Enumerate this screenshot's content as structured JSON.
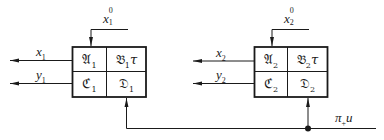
{
  "diagram": {
    "blocks": [
      {
        "id": "block-1",
        "input_label": {
          "base": "x",
          "sup": "0",
          "sub": "1"
        },
        "outputs": [
          {
            "base": "x",
            "sub": "1"
          },
          {
            "base": "y",
            "sub": "1"
          }
        ],
        "cells": {
          "top_left": {
            "base": "𝔄",
            "sub": "1",
            "suffix": ""
          },
          "top_right": {
            "base": "𝔅",
            "sub": "1",
            "suffix": "τ"
          },
          "bottom_left": {
            "base": "ℭ",
            "sub": "1",
            "suffix": ""
          },
          "bottom_right": {
            "base": "𝔇",
            "sub": "1",
            "suffix": ""
          }
        }
      },
      {
        "id": "block-2",
        "input_label": {
          "base": "x",
          "sup": "0",
          "sub": "2"
        },
        "outputs": [
          {
            "base": "x",
            "sub": "2"
          },
          {
            "base": "y",
            "sub": "2"
          }
        ],
        "cells": {
          "top_left": {
            "base": "𝔄",
            "sub": "2",
            "suffix": ""
          },
          "top_right": {
            "base": "𝔅",
            "sub": "2",
            "suffix": "τ"
          },
          "bottom_left": {
            "base": "ℭ",
            "sub": "2",
            "suffix": ""
          },
          "bottom_right": {
            "base": "𝔇",
            "sub": "2",
            "suffix": ""
          }
        }
      }
    ],
    "shared_input": {
      "base": "π",
      "sub": "+",
      "suffix": "u"
    },
    "colors": {
      "line": "#1a1a1a",
      "background": "#ffffff"
    }
  }
}
